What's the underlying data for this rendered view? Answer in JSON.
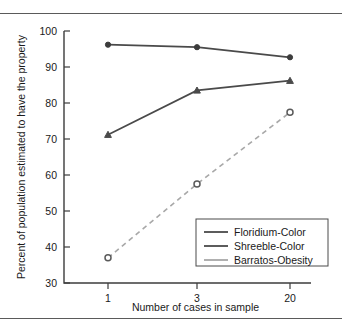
{
  "chart_data": {
    "type": "line",
    "title": "",
    "xlabel": "Number of cases in sample",
    "ylabel": "Percent of population estimated to have the property",
    "categories": [
      "1",
      "3",
      "20"
    ],
    "x": [
      1,
      3,
      20
    ],
    "xtick_labels": [
      "1",
      "3",
      "20"
    ],
    "ytick_labels": [
      "30",
      "40",
      "50",
      "60",
      "70",
      "80",
      "90",
      "100"
    ],
    "yticks": [
      30,
      40,
      50,
      60,
      70,
      80,
      90,
      100
    ],
    "ylim": [
      30,
      100
    ],
    "grid": false,
    "legend_position": "lower right",
    "series": [
      {
        "name": "Floridium-Color",
        "values": [
          96.2,
          95.5,
          92.7
        ],
        "color": "#4a4a4a",
        "style": "solid",
        "marker": "filled-circle"
      },
      {
        "name": "Shreeble-Color",
        "values": [
          71.2,
          83.5,
          86.2
        ],
        "color": "#4a4a4a",
        "style": "solid",
        "marker": "filled-triangle"
      },
      {
        "name": "Barratos-Obesity",
        "values": [
          37.0,
          57.5,
          77.4
        ],
        "color": "#a8a8a8",
        "style": "dashed",
        "marker": "open-circle"
      }
    ]
  },
  "legend": {
    "entries": [
      {
        "label": "Floridium-Color"
      },
      {
        "label": "Shreeble-Color"
      },
      {
        "label": "Barratos-Obesity"
      }
    ]
  },
  "axes": {
    "y_title": "Percent of population estimated to have the property",
    "x_title": "Number of cases in sample"
  }
}
